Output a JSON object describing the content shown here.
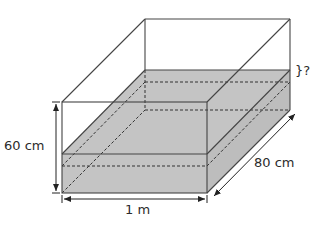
{
  "diagram": {
    "type": "3d-rectangular-tank",
    "labels": {
      "height": "60 cm",
      "width": "1 m",
      "depth": "80 cm",
      "unknown": "}?"
    },
    "colors": {
      "water_fill": "#c4c4c4",
      "edge": "#444444",
      "background": "#ffffff"
    }
  }
}
